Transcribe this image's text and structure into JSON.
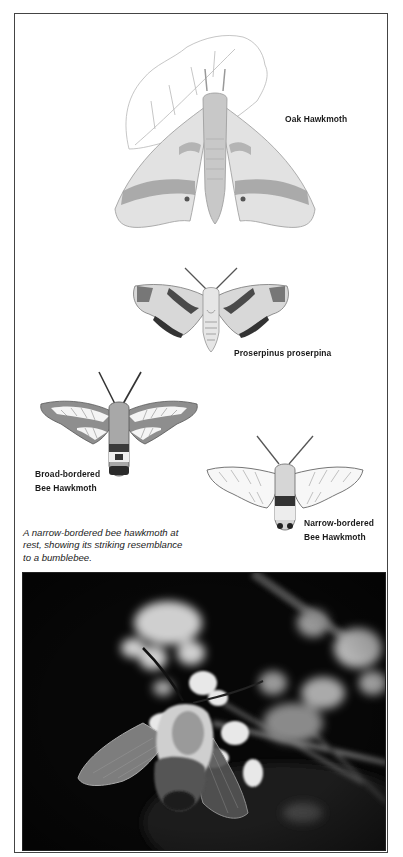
{
  "plate": {
    "species": [
      {
        "id": "oak-hawkmoth",
        "label_lines": [
          "Oak Hawkmoth"
        ]
      },
      {
        "id": "proserpinus-proserpina",
        "label_lines": [
          "Proserpinus proserpina"
        ]
      },
      {
        "id": "broad-bordered-bee-hawkmoth",
        "label_lines": [
          "Broad-bordered",
          "Bee Hawkmoth"
        ]
      },
      {
        "id": "narrow-bordered-bee-hawkmoth",
        "label_lines": [
          "Narrow-bordered",
          "Bee Hawkmoth"
        ]
      }
    ],
    "caption_lines": [
      "A narrow-bordered bee hawkmoth at",
      "rest, showing its striking resemblance",
      "to a bumblebee."
    ]
  },
  "colors": {
    "border": "#444444",
    "photo_background": "#050505",
    "label_text": "#1a1a1a"
  }
}
